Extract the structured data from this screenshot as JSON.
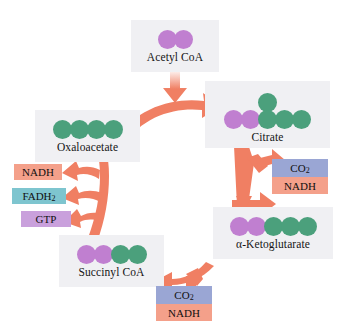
{
  "diagram": {
    "background_color": "#ffffff",
    "arrow_color": "#f07f63",
    "box_color": "#f0f0f3",
    "atom_colors": {
      "carbon_green": "#4ba07c",
      "carbon_purple": "#c07fd0"
    }
  },
  "molecules": [
    {
      "id": "acetyl-coa",
      "label": "Acetyl CoA",
      "atoms": [
        {
          "color": "purple",
          "row": "main"
        },
        {
          "color": "purple",
          "row": "main"
        }
      ]
    },
    {
      "id": "citrate",
      "label": "Citrate",
      "atoms": [
        {
          "color": "purple",
          "row": "main"
        },
        {
          "color": "purple",
          "row": "main"
        },
        {
          "color": "green",
          "row": "top"
        },
        {
          "color": "green",
          "row": "main"
        },
        {
          "color": "green",
          "row": "main"
        },
        {
          "color": "green",
          "row": "main"
        }
      ]
    },
    {
      "id": "alpha-ketoglutarate",
      "label": "α-Ketoglutarate",
      "atoms": [
        {
          "color": "purple",
          "row": "main"
        },
        {
          "color": "purple",
          "row": "main"
        },
        {
          "color": "green",
          "row": "main"
        },
        {
          "color": "green",
          "row": "main"
        },
        {
          "color": "green",
          "row": "main"
        }
      ]
    },
    {
      "id": "succinyl-coa",
      "label": "Succinyl CoA",
      "atoms": [
        {
          "color": "purple",
          "row": "main"
        },
        {
          "color": "purple",
          "row": "main"
        },
        {
          "color": "green",
          "row": "main"
        },
        {
          "color": "green",
          "row": "main"
        }
      ]
    },
    {
      "id": "oxaloacetate",
      "label": "Oxaloacetate",
      "atoms": [
        {
          "color": "green",
          "row": "main"
        },
        {
          "color": "green",
          "row": "main"
        },
        {
          "color": "green",
          "row": "main"
        },
        {
          "color": "green",
          "row": "main"
        }
      ]
    }
  ],
  "products": [
    {
      "id": "nadh-left",
      "label": "NADH",
      "color": "#f4a08a"
    },
    {
      "id": "fadh2-left",
      "label": "FADH",
      "sub": "2",
      "color": "#7ec5cf"
    },
    {
      "id": "gtp-left",
      "label": "GTP",
      "color": "#c9a0dc"
    }
  ],
  "gas_releases": [
    {
      "id": "co2-nadh-right",
      "lines": [
        {
          "label": "CO",
          "sub": "2",
          "color": "#9aa6d4"
        },
        {
          "label": "NADH",
          "color": "#f4a08a"
        }
      ]
    },
    {
      "id": "co2-nadh-bottom",
      "lines": [
        {
          "label": "CO",
          "sub": "2",
          "color": "#9aa6d4"
        },
        {
          "label": "NADH",
          "color": "#f4a08a"
        }
      ]
    }
  ],
  "arrows": [
    {
      "id": "acetyl-coa-to-cycle",
      "from": "acetyl-coa",
      "to": "citrate"
    },
    {
      "id": "oxaloacetate-to-citrate",
      "from": "oxaloacetate",
      "to": "citrate"
    },
    {
      "id": "citrate-to-ketoglutarate",
      "from": "citrate",
      "to": "alpha-ketoglutarate"
    },
    {
      "id": "ketoglutarate-co2-branch",
      "from": "citrate",
      "to": "co2-nadh-right"
    },
    {
      "id": "ketoglutarate-to-succinyl",
      "from": "alpha-ketoglutarate",
      "to": "succinyl-coa"
    },
    {
      "id": "succinyl-co2-branch",
      "from": "alpha-ketoglutarate",
      "to": "co2-nadh-bottom"
    },
    {
      "id": "succinyl-to-oxaloacetate",
      "from": "succinyl-coa",
      "to": "oxaloacetate"
    },
    {
      "id": "branch-to-nadh",
      "from": "succinyl-coa",
      "to": "nadh-left"
    },
    {
      "id": "branch-to-fadh2",
      "from": "succinyl-coa",
      "to": "fadh2-left"
    },
    {
      "id": "branch-to-gtp",
      "from": "succinyl-coa",
      "to": "gtp-left"
    }
  ]
}
